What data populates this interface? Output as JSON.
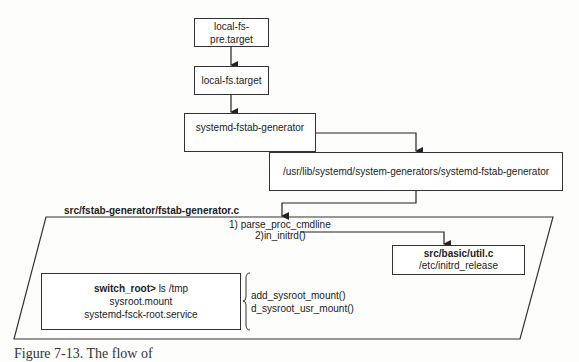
{
  "diagram": {
    "nodes": {
      "local_fs_pre": {
        "label": "local-fs-pre.target"
      },
      "local_fs": {
        "label": "local-fs.target"
      },
      "fstab_gen": {
        "label": "systemd-fstab-generator"
      },
      "gen_path": {
        "label": "/usr/lib/systemd/system-generators/systemd-fstab-generator"
      },
      "source_file": {
        "label": "src/fstab-generator/fstab-generator.c"
      },
      "step1": {
        "label": "1) parse_proc_cmdline"
      },
      "step2": {
        "label": "2)in_initrd()"
      },
      "util": {
        "title": "src/basic/util.c",
        "detail": "/etc/initrd_release"
      },
      "switch_root": {
        "prompt": "switch_root>",
        "command": " ls /tmp",
        "line2": "sysroot.mount",
        "line3": "systemd-fsck-root.service"
      },
      "funcs": {
        "line1": "add_sysroot_mount()",
        "line2": "d_sysroot_usr_mount()"
      }
    },
    "edges": [
      {
        "from": "local-fs-pre.target",
        "to": "local-fs.target"
      },
      {
        "from": "local-fs.target",
        "to": "systemd-fstab-generator"
      },
      {
        "from": "systemd-fstab-generator",
        "to": "/usr/lib/systemd/system-generators/systemd-fstab-generator"
      },
      {
        "from": "/usr/lib/systemd/system-generators/systemd-fstab-generator",
        "to": "src/fstab-generator/fstab-generator.c"
      },
      {
        "from": "2)in_initrd()",
        "to": "src/basic/util.c"
      }
    ]
  },
  "caption": "Figure 7-13. The flow of"
}
